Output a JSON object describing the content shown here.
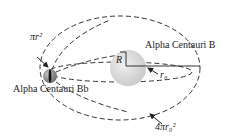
{
  "labels": {
    "planet": "Alpha Centauri Bb",
    "star": "Alpha Centauri B",
    "planet_area": "πr²",
    "star_radius": "R",
    "orbit_radius": "r₀",
    "sphere_area": "4πr₀²"
  },
  "colors": {
    "line": "#333333",
    "star_fill": "#d9d9d9",
    "planet_fill": "#8a8a8a"
  }
}
